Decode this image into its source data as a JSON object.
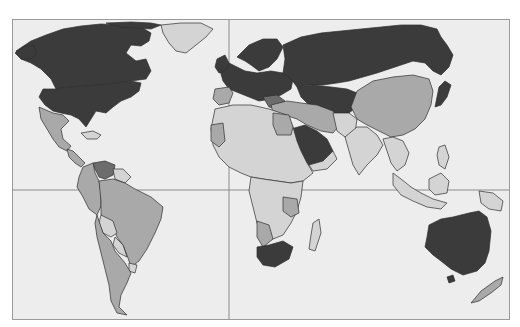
{
  "map": {
    "type": "choropleth world map (grayscale)",
    "projection": "Mercator-like, Pacific-centered cut at Americas",
    "colors": {
      "ocean": "#ededed",
      "level_1_dark": "#3b3b3b",
      "level_2_medium_dark": "#6c6c6c",
      "level_3_medium": "#a9a9a9",
      "level_4_light": "#d4d4d4",
      "frame": "#9a9a9a",
      "gridline": "#8c8c8c"
    },
    "gridlines": {
      "equator_y": 189,
      "prime_meridian_x": 228
    },
    "regions": [
      {
        "name": "canada",
        "shade": "level_1_dark"
      },
      {
        "name": "united-states",
        "shade": "level_1_dark"
      },
      {
        "name": "greenland",
        "shade": "level_4_light"
      },
      {
        "name": "mexico",
        "shade": "level_3_medium"
      },
      {
        "name": "central-america",
        "shade": "level_3_medium"
      },
      {
        "name": "venezuela",
        "shade": "level_2_medium_dark"
      },
      {
        "name": "brazil",
        "shade": "level_3_medium"
      },
      {
        "name": "andean-countries",
        "shade": "level_3_medium"
      },
      {
        "name": "bolivia",
        "shade": "level_4_light"
      },
      {
        "name": "paraguay",
        "shade": "level_4_light"
      },
      {
        "name": "argentina-chile",
        "shade": "level_3_medium"
      },
      {
        "name": "europe",
        "shade": "level_1_dark"
      },
      {
        "name": "iberia",
        "shade": "level_3_medium"
      },
      {
        "name": "russia-central-asia",
        "shade": "level_1_dark"
      },
      {
        "name": "china-mongolia",
        "shade": "level_3_medium"
      },
      {
        "name": "japan",
        "shade": "level_1_dark"
      },
      {
        "name": "middle-east-turkey-iran",
        "shade": "level_3_medium"
      },
      {
        "name": "saudi-arabia",
        "shade": "level_1_dark"
      },
      {
        "name": "india-south-asia",
        "shade": "level_4_light"
      },
      {
        "name": "southeast-asia",
        "shade": "level_4_light"
      },
      {
        "name": "indonesia-malaysia",
        "shade": "level_4_light"
      },
      {
        "name": "africa",
        "shade": "level_4_light"
      },
      {
        "name": "egypt",
        "shade": "level_3_medium"
      },
      {
        "name": "western-sahara-mauritania",
        "shade": "level_3_medium"
      },
      {
        "name": "south-africa",
        "shade": "level_1_dark"
      },
      {
        "name": "madagascar",
        "shade": "level_4_light"
      },
      {
        "name": "australia",
        "shade": "level_1_dark"
      },
      {
        "name": "papua-new-guinea",
        "shade": "level_4_light"
      },
      {
        "name": "new-zealand",
        "shade": "level_3_medium"
      }
    ]
  }
}
